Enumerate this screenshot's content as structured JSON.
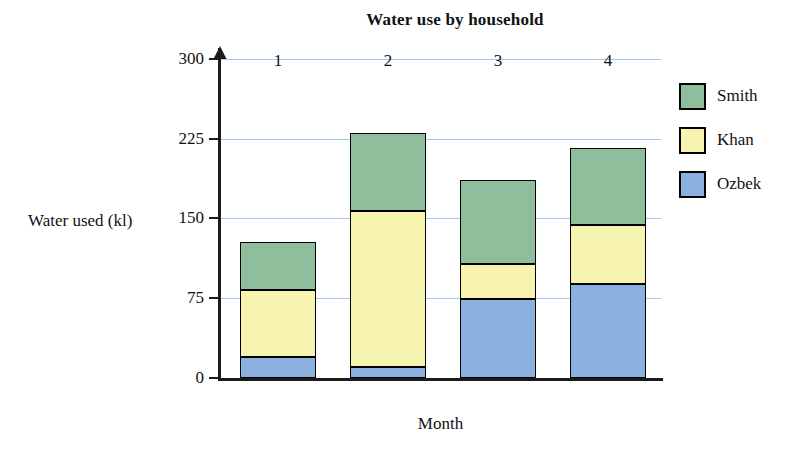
{
  "chart_data": {
    "type": "bar",
    "subtype": "stacked-bar",
    "title": "Water use by household",
    "xlabel": "Month",
    "ylabel": "Water used (kl)",
    "categories": [
      "1",
      "2",
      "3",
      "4"
    ],
    "series": [
      {
        "name": "Ozbek",
        "color": "#8cb0dd",
        "values": [
          20,
          10,
          74,
          88
        ]
      },
      {
        "name": "Khan",
        "color": "#f6f4b0",
        "values": [
          63,
          147,
          33,
          56
        ]
      },
      {
        "name": "Smith",
        "color": "#8fbe9c",
        "values": [
          45,
          73,
          79,
          72
        ]
      }
    ],
    "stack_order_bottom_to_top": [
      "Ozbek",
      "Khan",
      "Smith"
    ],
    "totals": [
      128,
      230,
      186,
      216
    ],
    "ylim": [
      0,
      311
    ],
    "yticks": [
      0,
      75,
      150,
      225,
      300
    ],
    "ytick_labels": [
      "0",
      "75",
      "150",
      "225",
      "300"
    ],
    "grid": true,
    "grid_color": "#9dc8ef",
    "legend_position": "right",
    "legend_entries": [
      "Smith",
      "Khan",
      "Ozbek"
    ]
  },
  "legend": {
    "items": [
      {
        "label": "Smith",
        "swatch": "green-swatch"
      },
      {
        "label": "Khan",
        "swatch": "yellow-swatch"
      },
      {
        "label": "Ozbek",
        "swatch": "blue-swatch"
      }
    ]
  },
  "axes": {
    "y_title": "Water used (kl)",
    "x_title": "Month",
    "y_labels": [
      "300",
      "225",
      "150",
      "75",
      "0"
    ],
    "x_labels": [
      "1",
      "2",
      "3",
      "4"
    ]
  }
}
